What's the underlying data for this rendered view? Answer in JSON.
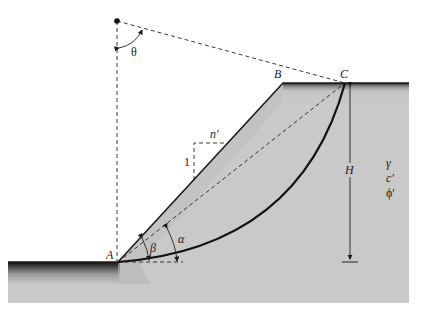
{
  "diagram": {
    "labels": {
      "theta": "θ",
      "point_a": "A",
      "point_b": "B",
      "point_c": "C",
      "slope_run": "n′",
      "slope_rise": "1",
      "height": "H",
      "beta": "β",
      "alpha": "α",
      "unit_weight": "γ",
      "cohesion": "c′",
      "friction_angle": "ϕ′"
    },
    "colors": {
      "soil_fill": "#c9c9c9",
      "soil_edge": "#1a1a1a",
      "line": "#1a1a1a",
      "background": "#ffffff"
    }
  }
}
